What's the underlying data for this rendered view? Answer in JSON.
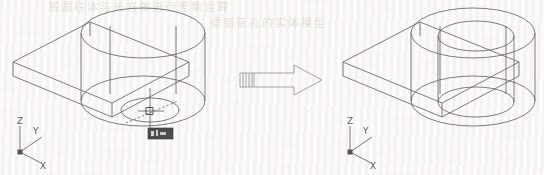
{
  "figure": {
    "caption_absent": true,
    "background_color": "#fbfbfa",
    "line_color": "#5a5a5a",
    "domain": "CAD wireframe illustration (isometric)"
  },
  "bleed_through_text": {
    "row1": "将圆柱体与长方体进行差集运算",
    "row2": "得到带孔的实体模型"
  },
  "left_view": {
    "name": "before-model",
    "label": "box with cylinder, inner circle selected",
    "ucs_icon": {
      "z": "Z",
      "y": "Y",
      "x": "X"
    },
    "cursor": {
      "type": "crosshair-pickbox",
      "visible": true
    },
    "tooltip": {
      "visible": true,
      "text": "",
      "bg": "#4a4a4a"
    }
  },
  "transition": {
    "name": "transform-arrow",
    "direction": "right",
    "style": "outlined block arrow with hatched tail"
  },
  "right_view": {
    "name": "after-model",
    "label": "box with cylindrical through-hole",
    "ucs_icon": {
      "z": "Z",
      "y": "Y",
      "x": "X"
    }
  }
}
